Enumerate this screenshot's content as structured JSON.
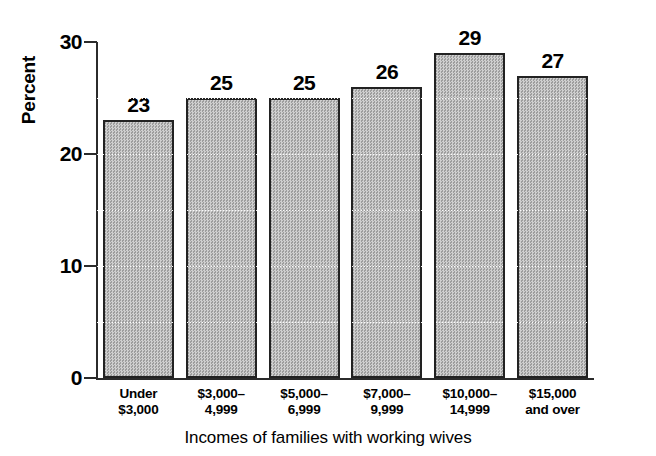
{
  "chart_data": {
    "type": "bar",
    "title": "",
    "caption": "Incomes of families with working wives",
    "xlabel": "Incomes of families with working wives",
    "ylabel": "Percent",
    "ylim": [
      0,
      30
    ],
    "yticks": [
      0,
      10,
      20,
      30
    ],
    "ytick_labels": [
      "0",
      "10",
      "20",
      "30"
    ],
    "grid": true,
    "gridline_interval": 5,
    "legend": null,
    "categories": [
      "Under $3,000",
      "$3,000–4,999",
      "$5,000–6,999",
      "$7,000–9,999",
      "$10,000–14,999",
      "$15,000 and over"
    ],
    "category_lines": [
      [
        "Under",
        "$3,000"
      ],
      [
        "$3,000–",
        "4,999"
      ],
      [
        "$5,000–",
        "6,999"
      ],
      [
        "$7,000–",
        "9,999"
      ],
      [
        "$10,000–",
        "14,999"
      ],
      [
        "$15,000",
        "and over"
      ]
    ],
    "values": [
      23,
      25,
      25,
      26,
      29,
      27
    ],
    "value_labels": [
      "23",
      "25",
      "25",
      "26",
      "29",
      "27"
    ],
    "colors": {
      "bar_fill": "#b4b4b4",
      "bar_edge": "#222222",
      "axis": "#2b2b2b",
      "text": "#000000",
      "background": "#ffffff"
    }
  }
}
